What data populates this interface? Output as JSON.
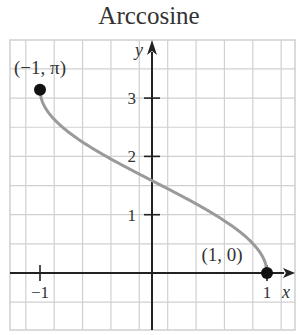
{
  "header": {
    "title_partial": "Inverse Trigonometric",
    "title": "Arccosine"
  },
  "chart_data": {
    "type": "line",
    "title": "Arccosine",
    "xlabel": "x",
    "ylabel": "y",
    "function": "y = arccos(x)",
    "xlim": [
      -1.125,
      1.125
    ],
    "ylim": [
      -0.5,
      4
    ],
    "grid": true,
    "grid_step_x": 0.25,
    "grid_step_y": 0.5,
    "x_ticks": [
      -1,
      1
    ],
    "x_tick_labels": [
      "−1",
      "1"
    ],
    "y_ticks": [
      1,
      2,
      3
    ],
    "y_tick_labels": [
      "1",
      "2",
      "3"
    ],
    "series": [
      {
        "name": "arccos",
        "color": "#9a9a9a",
        "x": [
          -1,
          -0.9,
          -0.75,
          -0.5,
          -0.25,
          0,
          0.25,
          0.5,
          0.75,
          0.9,
          1
        ],
        "values": [
          3.1416,
          2.6906,
          2.4189,
          2.0944,
          1.8235,
          1.5708,
          1.3181,
          1.0472,
          0.7227,
          0.451,
          0
        ]
      }
    ],
    "points": [
      {
        "x": -1,
        "y": 3.1416,
        "label": "(−1, π)"
      },
      {
        "x": 1,
        "y": 0,
        "label": "(1, 0)"
      }
    ]
  }
}
